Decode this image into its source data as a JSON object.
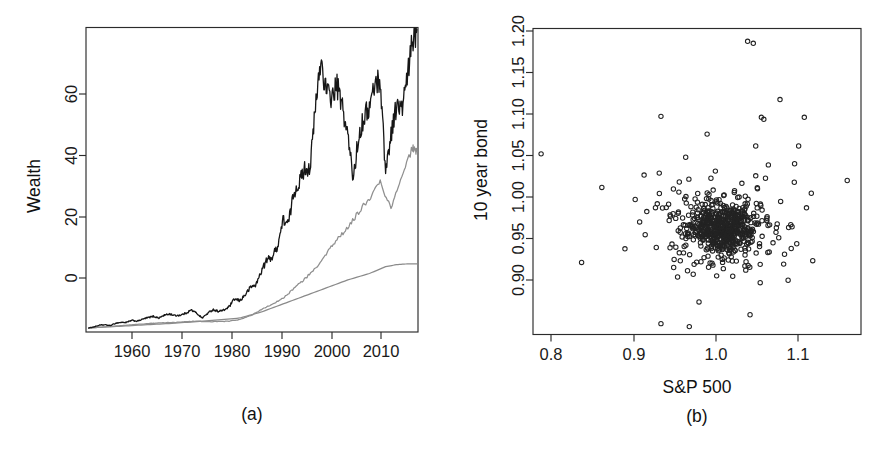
{
  "figure": {
    "background_color": "#ffffff",
    "panels": [
      "a",
      "b"
    ]
  },
  "panel_a": {
    "caption": "(a)",
    "ylabel": "Wealth",
    "xlabel": "",
    "y_tick_labels": [
      "0",
      "20",
      "40",
      "60"
    ],
    "x_tick_labels": [
      "1960",
      "1970",
      "1980",
      "1990",
      "2000",
      "2010"
    ]
  },
  "panel_b": {
    "caption": "(b)",
    "ylabel": "10 year bond",
    "xlabel": "S&P 500",
    "y_tick_labels": [
      "0.90",
      "0.95",
      "1.00",
      "1.05",
      "1.10",
      "1.15",
      "1.20"
    ],
    "x_tick_labels": [
      "0.8",
      "0.9",
      "1.0",
      "1.1"
    ]
  },
  "chart_data": [
    {
      "type": "line",
      "panel": "a",
      "title": "",
      "xlabel": "",
      "ylabel": "Wealth",
      "xlim": [
        1953.0,
        2014.5
      ],
      "ylim": [
        0,
        76
      ],
      "xticks": [
        1960,
        1970,
        1980,
        1990,
        2000,
        2010
      ],
      "yticks": [
        0,
        20,
        40,
        60
      ],
      "grid": false,
      "legend": "none",
      "series": [
        {
          "name": "stock-wealth",
          "color": "#161616",
          "linewidth": 1.3,
          "x": [
            1953.5,
            1954.5,
            1955.5,
            1956.5,
            1957.5,
            1958.5,
            1959.5,
            1960.5,
            1961.5,
            1962.5,
            1963.5,
            1964.5,
            1965.5,
            1966.5,
            1967.5,
            1968.5,
            1969.5,
            1970.5,
            1971.5,
            1972.5,
            1973.5,
            1974.5,
            1975.5,
            1976.5,
            1977.5,
            1978.5,
            1979.5,
            1980.5,
            1981.5,
            1982.5,
            1983.5,
            1984.5,
            1985.5,
            1986.5,
            1987.5,
            1988.5,
            1989.5,
            1990.5,
            1991.5,
            1992.5,
            1993.5,
            1994.5,
            1995.5,
            1996.5,
            1997.5,
            1998.5,
            1999.5,
            2000.5,
            2001.5,
            2002.5,
            2003.5,
            2004.5,
            2005.5,
            2006.5,
            2007.5,
            2008.5,
            2009.5,
            2010.5,
            2011.5,
            2012.5,
            2013.5,
            2014.3
          ],
          "y": [
            1.0,
            1.3,
            1.7,
            1.8,
            1.6,
            2.2,
            2.4,
            2.4,
            2.9,
            2.7,
            3.2,
            3.6,
            3.9,
            3.5,
            4.2,
            4.5,
            4.1,
            4.2,
            4.7,
            5.5,
            4.7,
            3.5,
            4.6,
            5.6,
            5.2,
            5.4,
            6.3,
            8.2,
            7.8,
            9.3,
            11.2,
            11.8,
            15.3,
            18.0,
            18.7,
            21.5,
            28.0,
            27.0,
            34.9,
            37.3,
            40.8,
            41.0,
            55.8,
            68.0,
            60.0,
            58.5,
            61.5,
            56.0,
            49.0,
            38.2,
            48.8,
            53.8,
            56.0,
            62.0,
            63.0,
            40.0,
            49.5,
            56.5,
            55.5,
            63.0,
            73.0,
            75.5
          ]
        },
        {
          "name": "mixed-wealth",
          "color": "#8f8f8f",
          "linewidth": 1.25,
          "x": [
            1953.5,
            1955.5,
            1957.5,
            1959.5,
            1961.5,
            1963.5,
            1965.5,
            1967.5,
            1969.5,
            1971.5,
            1973.5,
            1975.5,
            1977.5,
            1979.5,
            1981.5,
            1983.5,
            1985.5,
            1987.5,
            1989.5,
            1991.5,
            1993.5,
            1995.5,
            1997.5,
            1999.5,
            2001.5,
            2003.5,
            2005.5,
            2007.5,
            2009.5,
            2011.5,
            2013.5,
            2014.3
          ],
          "y": [
            1.0,
            1.2,
            1.4,
            1.6,
            1.8,
            2.0,
            2.2,
            2.3,
            2.4,
            2.6,
            2.7,
            2.6,
            2.6,
            2.7,
            3.1,
            4.1,
            5.6,
            7.0,
            8.4,
            10.8,
            13.2,
            16.0,
            19.5,
            23.0,
            26.0,
            30.0,
            33.5,
            37.5,
            31.0,
            39.0,
            46.0,
            45.0
          ]
        },
        {
          "name": "bond-wealth",
          "color": "#8a8a8a",
          "linewidth": 1.25,
          "x": [
            1953.5,
            1957.5,
            1961.5,
            1965.5,
            1969.5,
            1973.5,
            1977.5,
            1981.5,
            1985.5,
            1989.5,
            1993.5,
            1997.5,
            2001.5,
            2005.5,
            2008.5,
            2010.5,
            2012.5,
            2014.3
          ],
          "y": [
            1.0,
            1.3,
            1.6,
            1.9,
            2.2,
            2.6,
            3.0,
            3.5,
            5.0,
            7.0,
            9.0,
            11.0,
            13.0,
            14.6,
            16.3,
            16.8,
            17.0,
            17.0
          ]
        }
      ]
    },
    {
      "type": "scatter",
      "panel": "b",
      "title": "",
      "xlabel": "S&P 500",
      "ylabel": "10 year bond",
      "xlim": [
        0.77,
        1.175
      ],
      "ylim": [
        0.895,
        1.205
      ],
      "xticks": [
        0.8,
        0.9,
        1.0,
        1.1
      ],
      "yticks": [
        0.9,
        0.95,
        1.0,
        1.05,
        1.1,
        1.15,
        1.2
      ],
      "grid": false,
      "legend": "none",
      "marker": "open-circle",
      "marker_color": "#232323",
      "n_points": 720,
      "cluster_center": [
        1.005,
        1.003
      ],
      "notable_points": [
        [
          0.78,
          1.078
        ],
        [
          0.83,
          0.968
        ],
        [
          0.855,
          1.044
        ],
        [
          1.035,
          1.192
        ],
        [
          1.042,
          1.19
        ],
        [
          1.075,
          1.133
        ],
        [
          0.928,
          1.116
        ],
        [
          1.105,
          1.115
        ],
        [
          1.052,
          1.115
        ],
        [
          1.055,
          1.113
        ],
        [
          0.985,
          1.098
        ],
        [
          1.045,
          1.086
        ],
        [
          1.098,
          1.086
        ],
        [
          1.158,
          1.051
        ],
        [
          1.093,
          1.068
        ],
        [
          0.963,
          0.903
        ],
        [
          0.928,
          0.906
        ],
        [
          1.038,
          0.915
        ],
        [
          0.975,
          0.928
        ],
        [
          1.085,
          0.95
        ]
      ]
    }
  ]
}
